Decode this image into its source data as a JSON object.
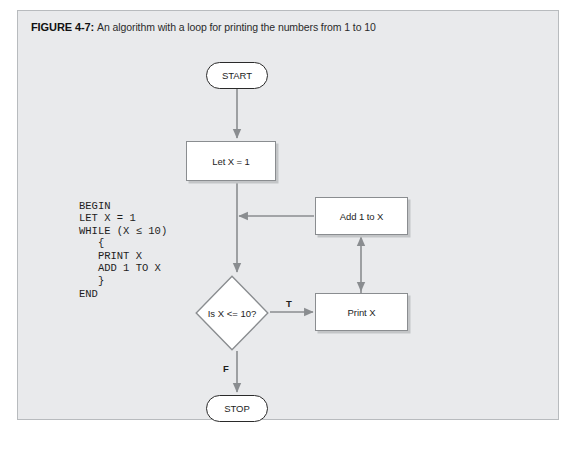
{
  "figure": {
    "label": "FIGURE 4-7:",
    "caption": "An algorithm with a loop for printing the numbers from 1 to 10"
  },
  "pseudocode": {
    "text": "BEGIN\nLET X = 1\nWHILE (X ≤ 10)\n   {\n   PRINT X\n   ADD 1 TO X\n   }\nEND",
    "lines": [
      "BEGIN",
      "LET X = 1",
      "WHILE (X ≤ 10)",
      "   {",
      "   PRINT X",
      "   ADD 1 TO X",
      "   }",
      "END"
    ]
  },
  "flowchart": {
    "nodes": {
      "start": "START",
      "let_x": "Let X = 1",
      "decision": "Is X <= 10?",
      "add_one": "Add 1 to X",
      "print_x": "Print X",
      "stop": "STOP"
    },
    "branch_labels": {
      "true": "T",
      "false": "F"
    }
  },
  "colors": {
    "panel_background": "#e9eaec",
    "panel_border": "#b8bbbe",
    "node_fill": "#ffffff",
    "process_border": "#8a8d90",
    "process_shadow": "#c3c5c7",
    "terminator_border": "#2a2a2a",
    "connector": "#8a8d90",
    "text": "#1d1d1d"
  }
}
